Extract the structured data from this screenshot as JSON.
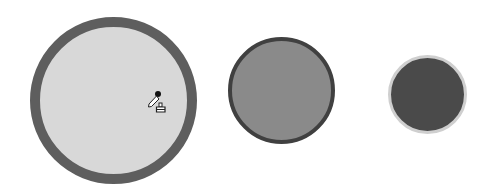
{
  "swatches": [
    {
      "id": "large",
      "fill": "#d8d8d8",
      "border": "#5e5e5e",
      "selected": true
    },
    {
      "id": "medium",
      "fill": "#8a8a8a",
      "border": "#404040",
      "selected": false
    },
    {
      "id": "small",
      "fill": "#4a4a4a",
      "border": "#cfcfcf",
      "selected": false
    }
  ],
  "cursor": {
    "icon": "eyedropper-fill-icon"
  }
}
